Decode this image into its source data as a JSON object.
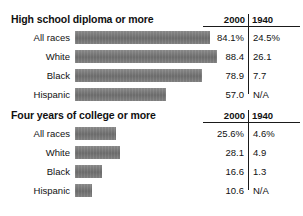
{
  "chart_data": {
    "type": "bar",
    "xlabel": "",
    "ylabel": "",
    "categories": [
      "All races",
      "White",
      "Black",
      "Hispanic"
    ],
    "columns": [
      "2000",
      "1940"
    ],
    "grid": false,
    "legend": "none",
    "bar_color": "#7d7d7d",
    "xlim": [
      0,
      100
    ],
    "panels": [
      {
        "title": "High school diploma or more",
        "col_2000_label": "2000",
        "col_1940_label": "1940",
        "rows": [
          {
            "label": "All races",
            "v2000": "84.1%",
            "v1940": "24.5%",
            "bar": 84.1
          },
          {
            "label": "White",
            "v2000": "88.4",
            "v1940": "26.1",
            "bar": 88.4
          },
          {
            "label": "Black",
            "v2000": "78.9",
            "v1940": "7.7",
            "bar": 78.9
          },
          {
            "label": "Hispanic",
            "v2000": "57.0",
            "v1940": "N/A",
            "bar": 57.0
          }
        ]
      },
      {
        "title": "Four years of college or more",
        "col_2000_label": "2000",
        "col_1940_label": "1940",
        "rows": [
          {
            "label": "All races",
            "v2000": "25.6%",
            "v1940": "4.6%",
            "bar": 25.6
          },
          {
            "label": "White",
            "v2000": "28.1",
            "v1940": "4.9",
            "bar": 28.1
          },
          {
            "label": "Black",
            "v2000": "16.6",
            "v1940": "1.3",
            "bar": 16.6
          },
          {
            "label": "Hispanic",
            "v2000": "10.6",
            "v1940": "N/A",
            "bar": 10.6
          }
        ]
      }
    ]
  },
  "top_artifact": {
    "text": ""
  }
}
